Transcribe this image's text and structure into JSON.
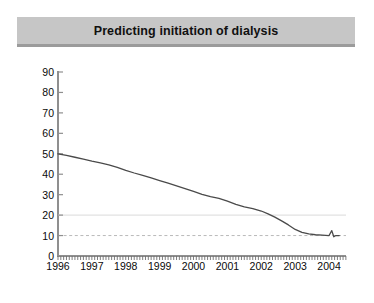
{
  "figure": {
    "title": "Predicting initiation of dialysis",
    "background_color": "#ffffff",
    "banner_color": "#c6c6c6",
    "rule_color": "#9b9b9b"
  },
  "chart_data": {
    "type": "line",
    "title": "Predicting initiation of dialysis",
    "xlabel": "",
    "ylabel": "GFR (MDRD equation) ml/min",
    "xlim": [
      1996,
      2004.5
    ],
    "ylim": [
      0,
      90
    ],
    "yticks": [
      0,
      10,
      20,
      30,
      40,
      50,
      60,
      70,
      80,
      90
    ],
    "ytick_labels": [
      "0",
      "10",
      "20",
      "30",
      "40",
      "50",
      "60",
      "70",
      "80",
      "90"
    ],
    "xticks": [
      1996,
      1997,
      1998,
      1999,
      2000,
      2001,
      2002,
      2003,
      2004
    ],
    "xtick_labels": [
      "1996",
      "1997",
      "1998",
      "1999",
      "2000",
      "2001",
      "2002",
      "2003",
      "2004"
    ],
    "minor_xticks": true,
    "minor_tick_interval_years": 0.0833,
    "grid": false,
    "legend": null,
    "line_color": "#4a4a4a",
    "line_width": 1.3,
    "series": [
      {
        "name": "GFR (MDRD equation)",
        "x": [
          1996.0,
          1996.25,
          1996.5,
          1996.75,
          1997.0,
          1997.25,
          1997.5,
          1997.75,
          1998.0,
          1998.25,
          1998.5,
          1998.75,
          1999.0,
          1999.25,
          1999.5,
          1999.75,
          2000.0,
          2000.25,
          2000.5,
          2000.75,
          2001.0,
          2001.25,
          2001.5,
          2001.75,
          2002.0,
          2002.2,
          2002.4,
          2002.6,
          2002.8,
          2003.0,
          2003.2,
          2003.4,
          2003.6,
          2003.8,
          2004.0,
          2004.08,
          2004.14,
          2004.2,
          2004.3
        ],
        "y": [
          50.0,
          49.2,
          48.3,
          47.4,
          46.4,
          45.5,
          44.6,
          43.4,
          41.9,
          40.6,
          39.4,
          38.2,
          36.9,
          35.6,
          34.3,
          33.0,
          31.6,
          30.2,
          29.0,
          28.2,
          26.8,
          25.2,
          24.0,
          23.2,
          22.0,
          20.6,
          19.0,
          17.2,
          15.2,
          13.0,
          11.6,
          10.8,
          10.4,
          10.2,
          10.0,
          12.4,
          9.4,
          10.0,
          10.0
        ]
      }
    ],
    "reference_lines": [
      {
        "name": "gfr-20-reference",
        "value": 20,
        "orientation": "horizontal",
        "style": "solid",
        "color": "#e2e2e2"
      },
      {
        "name": "gfr-10-reference",
        "value": 10,
        "orientation": "horizontal",
        "style": "dashed",
        "color": "#b9b9b9"
      }
    ]
  }
}
